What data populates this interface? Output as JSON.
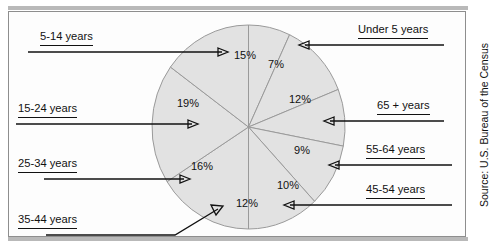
{
  "figure": {
    "source_note": "Source: U.S. Bureau of the Census"
  },
  "chart_data": {
    "type": "pie",
    "title": "",
    "xlabel": "",
    "ylabel": "",
    "legend_position": "callouts-around-pie",
    "grid": false,
    "unit": "%",
    "categories": [
      "Under 5 years",
      "65 +  years",
      "55-64 years",
      "45-54 years",
      "35-44 years",
      "25-34 years",
      "15-24 years",
      "5-14 years"
    ],
    "values": [
      7,
      12,
      9,
      10,
      12,
      16,
      19,
      15
    ],
    "slices": [
      {
        "label": "Under 5 years",
        "value": 7,
        "display": "7%",
        "pct_x": 276,
        "pct_y": 65,
        "callout_side": "right"
      },
      {
        "label": "65 +  years",
        "value": 12,
        "display": "12%",
        "pct_x": 300,
        "pct_y": 100,
        "callout_side": "right"
      },
      {
        "label": "55-64 years",
        "value": 9,
        "display": "9%",
        "pct_x": 302,
        "pct_y": 151,
        "callout_side": "right"
      },
      {
        "label": "45-54 years",
        "value": 10,
        "display": "10%",
        "pct_x": 288,
        "pct_y": 186,
        "callout_side": "right"
      },
      {
        "label": "35-44 years",
        "value": 12,
        "display": "12%",
        "pct_x": 247,
        "pct_y": 204,
        "callout_side": "left"
      },
      {
        "label": "25-34 years",
        "value": 16,
        "display": "16%",
        "pct_x": 202,
        "pct_y": 167,
        "callout_side": "left"
      },
      {
        "label": "15-24 years",
        "value": 19,
        "display": "19%",
        "pct_x": 188,
        "pct_y": 104,
        "callout_side": "left"
      },
      {
        "label": "5-14 years",
        "value": 15,
        "display": "15%",
        "pct_x": 245,
        "pct_y": 56,
        "callout_side": "left"
      }
    ],
    "callouts": {
      "c_5_14": "5-14 years",
      "c_15_24": "15-24 years",
      "c_25_34": "25-34 years",
      "c_35_44": "35-44 years",
      "c_under5": "Under 5 years",
      "c_65plus": "65 +  years",
      "c_55_64": "55-64 years",
      "c_45_54": "45-54 years"
    },
    "colors": {
      "slice_fill": "#e2e2e2",
      "slice_stroke": "#9a9a9a",
      "text": "#111111",
      "frame": "#8e8e8e"
    }
  }
}
